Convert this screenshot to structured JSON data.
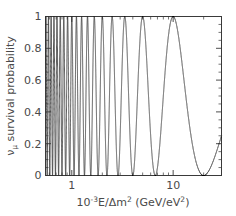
{
  "chart_data": {
    "type": "line",
    "title": "",
    "xlabel": "10^-3 E/Δm² (GeV/eV²)",
    "xlabel_parts": {
      "mantissa": "10",
      "exponent": "-3",
      "rest": "E/Δm",
      "rest_exponent": "2",
      "units_open": " (GeV/eV",
      "units_exponent": "2",
      "units_close": ")"
    },
    "ylabel": "νμ survival probability",
    "ylabel_parts": {
      "symbol": "ν",
      "subscript": "μ",
      "text": " survival probability"
    },
    "xscale": "log",
    "yscale": "linear",
    "xlim": [
      0.55,
      30
    ],
    "ylim": [
      0,
      1
    ],
    "xticks": [
      1,
      10
    ],
    "xticklabels": [
      "1",
      "10"
    ],
    "yticks": [
      0,
      0.2,
      0.4,
      0.6,
      0.8,
      1
    ],
    "yticklabels": [
      "0",
      "0.2",
      "0.4",
      "0.6",
      "0.8",
      "1"
    ],
    "grid": false,
    "legend": null,
    "series": [
      {
        "name": "nu_mu survival probability",
        "formula": "P = 1 - sin^2(2theta) * sin^2(pi * x0 / x)",
        "sin2_2theta": 1.0,
        "oscillation_scale_x0": 10.0,
        "color": "#333333",
        "linewidth": 0.85
      }
    ],
    "annotations": [],
    "features": {
      "first_minimum_x": 10.0,
      "last_maximum_x": 5.0,
      "value_at_right_edge": 0.88,
      "minima_at_x": [
        10.0,
        3.333,
        2.0,
        1.429,
        1.111,
        0.909,
        0.769,
        0.667,
        0.588
      ],
      "maxima_value": 1.0,
      "minima_value": 0.0
    }
  },
  "figure": {
    "background": "#ffffff",
    "frame_color": "#3a3a3a",
    "text_color": "#4a4a4a"
  }
}
